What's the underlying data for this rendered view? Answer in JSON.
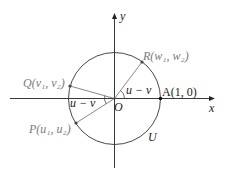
{
  "diagram": {
    "title": "",
    "axes": {
      "x_label": "x",
      "y_label": "y"
    },
    "origin_label": "O",
    "circle_label": "U",
    "points": {
      "A": {
        "label": "A(1, 0)"
      },
      "R": {
        "label": "R(w₁, w₂)"
      },
      "Q": {
        "label": "Q(v₁, v₂)"
      },
      "P": {
        "label": "P(u₁, u₂)"
      }
    },
    "angles": {
      "AOR": "u − v",
      "POQ": "u − v"
    }
  },
  "colors": {
    "axis": "#222222",
    "circle": "#333333",
    "ray": "#555555",
    "point_label": "#7a7a7a",
    "text": "#222222"
  }
}
